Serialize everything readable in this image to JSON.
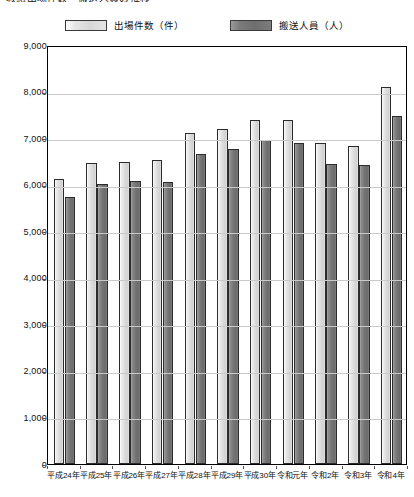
{
  "title": "救急出場件数・搬送人員の推移",
  "legend": {
    "items": [
      {
        "label": "出場件数（件）",
        "swatch": "light-gray-swatch",
        "color": "#d7d7d7"
      },
      {
        "label": "搬送人員（人）",
        "swatch": "dark-gray-swatch",
        "color": "#6e6e6e"
      }
    ]
  },
  "axis": {
    "y_ticks": [
      "9,000",
      "8,000",
      "7,000",
      "6,000",
      "5,000",
      "4,000",
      "3,000",
      "2,000",
      "1,000",
      "0"
    ]
  },
  "chart_data": {
    "type": "bar",
    "title": "救急出場件数・搬送人員の推移",
    "xlabel": "",
    "ylabel": "",
    "ylim": [
      0,
      9000
    ],
    "ytick_step": 1000,
    "grid": true,
    "legend_position": "top-center",
    "categories": [
      "平成24年",
      "平成25年",
      "平成26年",
      "平成27年",
      "平成28年",
      "平成29年",
      "平成30年",
      "令和元年",
      "令和2年",
      "令和3年",
      "令和4年"
    ],
    "series": [
      {
        "name": "出場件数（件）",
        "color": "#d7d7d7",
        "values": [
          6120,
          6460,
          6480,
          6530,
          7100,
          7190,
          7380,
          7400,
          6900,
          6830,
          8090
        ]
      },
      {
        "name": "搬送人員（人）",
        "color": "#6e6e6e",
        "values": [
          5730,
          6020,
          6080,
          6060,
          6650,
          6760,
          6950,
          6900,
          6450,
          6430,
          7480
        ]
      }
    ]
  }
}
